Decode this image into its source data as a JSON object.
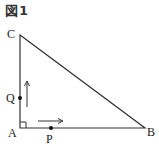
{
  "figure": {
    "title": "図1",
    "points": {
      "A": {
        "label": "A",
        "x": 20,
        "y": 128
      },
      "B": {
        "label": "B",
        "x": 145,
        "y": 128
      },
      "C": {
        "label": "C",
        "x": 20,
        "y": 35
      },
      "P": {
        "label": "P",
        "x": 51,
        "y": 128
      },
      "Q": {
        "label": "Q",
        "x": 20,
        "y": 98
      }
    },
    "right_angle_at": "A",
    "arrows": [
      {
        "name": "Q-direction",
        "direction": "up"
      },
      {
        "name": "P-direction",
        "direction": "right"
      }
    ],
    "colors": {
      "line": "#333333",
      "background": "#ffffff"
    }
  }
}
